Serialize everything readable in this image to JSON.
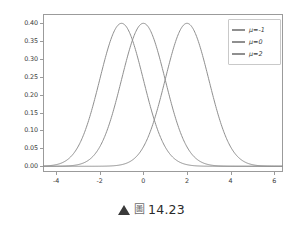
{
  "chart_data": {
    "type": "line",
    "title": "",
    "subtitle": "",
    "xlabel": "",
    "ylabel": "",
    "xlim": [
      -4.6,
      6.4
    ],
    "ylim": [
      -0.016,
      0.425
    ],
    "grid": false,
    "legend_position": "upper right",
    "xticks": [
      "-4",
      "-2",
      "0",
      "2",
      "4",
      "6"
    ],
    "xtick_values": [
      -4,
      -2,
      0,
      2,
      4,
      6
    ],
    "yticks": [
      "0.00",
      "0.05",
      "0.10",
      "0.15",
      "0.20",
      "0.25",
      "0.30",
      "0.35",
      "0.40"
    ],
    "ytick_values": [
      0.0,
      0.05,
      0.1,
      0.15,
      0.2,
      0.25,
      0.3,
      0.35,
      0.4
    ],
    "series": [
      {
        "name": "μ=-1",
        "mu": -1,
        "sigma": 1,
        "peak": 0.399,
        "color": "#8f8f8f",
        "x": [
          -4.6,
          -4.0,
          -3.5,
          -3.0,
          -2.5,
          -2.0,
          -1.5,
          -1.0,
          -0.5,
          0.0,
          0.5,
          1.0,
          1.5,
          2.0,
          2.5,
          3.0,
          3.5,
          4.0,
          5.0,
          6.0,
          6.4
        ],
        "values": [
          0.0044,
          0.0044,
          0.0175,
          0.054,
          0.1295,
          0.242,
          0.3521,
          0.3989,
          0.3521,
          0.242,
          0.1295,
          0.054,
          0.0175,
          0.0044,
          0.0009,
          0.0001,
          0.0,
          0.0,
          0.0,
          0.0,
          0.0
        ]
      },
      {
        "name": "μ=0",
        "mu": 0,
        "sigma": 1,
        "peak": 0.399,
        "color": "#8f8f8f",
        "x": [
          -4.6,
          -4.0,
          -3.5,
          -3.0,
          -2.5,
          -2.0,
          -1.5,
          -1.0,
          -0.5,
          0.0,
          0.5,
          1.0,
          1.5,
          2.0,
          2.5,
          3.0,
          3.5,
          4.0,
          5.0,
          6.0,
          6.4
        ],
        "values": [
          0.0,
          0.0001,
          0.0009,
          0.0044,
          0.0175,
          0.054,
          0.1295,
          0.242,
          0.3521,
          0.3989,
          0.3521,
          0.242,
          0.1295,
          0.054,
          0.0175,
          0.0044,
          0.0009,
          0.0001,
          0.0,
          0.0,
          0.0
        ]
      },
      {
        "name": "μ=2",
        "mu": 2,
        "sigma": 1,
        "peak": 0.399,
        "color": "#8f8f8f",
        "x": [
          -4.6,
          -4.0,
          -3.0,
          -2.0,
          -1.0,
          0.0,
          0.5,
          1.0,
          1.5,
          2.0,
          2.5,
          3.0,
          3.5,
          4.0,
          4.5,
          5.0,
          5.5,
          6.0,
          6.4
        ],
        "values": [
          0.0,
          0.0,
          0.0,
          0.0001,
          0.0044,
          0.054,
          0.1295,
          0.242,
          0.3521,
          0.3989,
          0.3521,
          0.242,
          0.1295,
          0.054,
          0.0175,
          0.0044,
          0.0009,
          0.0001,
          0.0
        ]
      }
    ],
    "legend_entries": [
      "μ=-1",
      "μ=0",
      "μ=2"
    ]
  },
  "legend": {
    "items": [
      {
        "label": "μ=-1"
      },
      {
        "label": "μ=0"
      },
      {
        "label": "μ=2"
      }
    ]
  },
  "axes": {
    "y_tick_labels": [
      "0.40",
      "0.35",
      "0.30",
      "0.25",
      "0.20",
      "0.15",
      "0.10",
      "0.05",
      "0.00"
    ],
    "x_tick_labels": [
      "-4",
      "-2",
      "0",
      "2",
      "4",
      "6"
    ]
  },
  "caption": {
    "marker": "▲",
    "figure_glyph": "圖",
    "number": "14.23",
    "full_text": "▲ 圖 14.23"
  },
  "colors": {
    "curve": "#8f8f8f",
    "frame": "#9b9b9b",
    "text": "#3b3b3b",
    "background": "#ffffff",
    "legend_border": "#c9c9c9"
  }
}
